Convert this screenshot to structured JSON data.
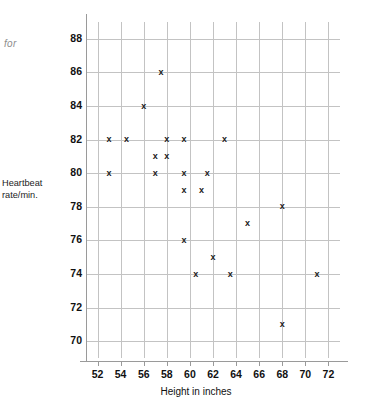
{
  "side_note": "for",
  "chart_data": {
    "type": "scatter",
    "title": "",
    "xlabel": "Height in inches",
    "ylabel": "Heartbeat rate/min.",
    "xlim": [
      51,
      73
    ],
    "ylim": [
      69,
      89
    ],
    "xticks": [
      52,
      54,
      56,
      58,
      60,
      62,
      64,
      66,
      68,
      70,
      72
    ],
    "yticks": [
      70,
      72,
      74,
      76,
      78,
      80,
      82,
      84,
      86,
      88
    ],
    "xtick_labels": [
      "52",
      "54",
      "56",
      "58",
      "60",
      "62",
      "64",
      "66",
      "68",
      "70",
      "72"
    ],
    "ytick_labels": [
      "70",
      "72",
      "74",
      "76",
      "78",
      "80",
      "82",
      "84",
      "86",
      "88"
    ],
    "grid": true,
    "legend": null,
    "marker": "x",
    "marker_glyph": "x",
    "marker_color": "#1a1a1a",
    "grid_color": "#c3c3c3",
    "axis_color": "#9a9a9a",
    "n_points": 23,
    "points": [
      {
        "x": 53.0,
        "y": 82
      },
      {
        "x": 53.0,
        "y": 80
      },
      {
        "x": 54.5,
        "y": 82
      },
      {
        "x": 56.0,
        "y": 84
      },
      {
        "x": 57.0,
        "y": 81
      },
      {
        "x": 57.0,
        "y": 80
      },
      {
        "x": 57.5,
        "y": 86
      },
      {
        "x": 58.0,
        "y": 82
      },
      {
        "x": 58.0,
        "y": 81
      },
      {
        "x": 59.5,
        "y": 82
      },
      {
        "x": 59.5,
        "y": 80
      },
      {
        "x": 59.5,
        "y": 79
      },
      {
        "x": 59.5,
        "y": 76
      },
      {
        "x": 60.5,
        "y": 74
      },
      {
        "x": 61.0,
        "y": 79
      },
      {
        "x": 61.5,
        "y": 80
      },
      {
        "x": 62.0,
        "y": 75
      },
      {
        "x": 63.0,
        "y": 82
      },
      {
        "x": 63.5,
        "y": 74
      },
      {
        "x": 65.0,
        "y": 77
      },
      {
        "x": 68.0,
        "y": 78
      },
      {
        "x": 68.0,
        "y": 71
      },
      {
        "x": 71.0,
        "y": 74
      }
    ]
  }
}
